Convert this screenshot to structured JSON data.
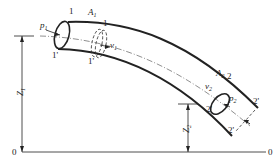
{
  "diagram": {
    "type": "pipe-flow-bernoulli",
    "section1": {
      "pressure": "p",
      "pressure_sub": "1",
      "area": "A",
      "area_sub": "1",
      "velocity": "v",
      "velocity_sub": "1",
      "marker_top": "1",
      "marker_bottom": "1'",
      "marker_top_shifted": "1",
      "marker_bottom_shifted": "1'"
    },
    "section2": {
      "pressure": "p",
      "pressure_sub": "2",
      "area": "A",
      "area_sub": "2",
      "velocity": "v",
      "velocity_sub": "2",
      "marker_top": "2",
      "marker_bottom": "2'",
      "marker_top_shifted": "2'",
      "marker_bottom_shifted": "2'"
    },
    "heights": {
      "z1": "Z",
      "z1_sub": "1",
      "z2": "Z",
      "z2_sub": "2"
    },
    "datum": {
      "left_label": "0",
      "right_label": "0"
    },
    "colors": {
      "line": "#222222",
      "background": "#ffffff"
    }
  }
}
